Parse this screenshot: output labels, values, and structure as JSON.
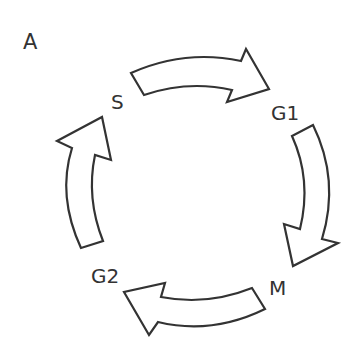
{
  "panel_label": "A",
  "diagram": {
    "type": "cycle",
    "phases": [
      {
        "id": "s",
        "label": "S"
      },
      {
        "id": "g1",
        "label": "G1"
      },
      {
        "id": "m",
        "label": "M"
      },
      {
        "id": "g2",
        "label": "G2"
      }
    ],
    "arrows": [
      {
        "from": "S",
        "to": "G1"
      },
      {
        "from": "G1",
        "to": "M"
      },
      {
        "from": "M",
        "to": "G2"
      },
      {
        "from": "G2",
        "to": "S"
      }
    ],
    "stroke_color": "#333333",
    "fill_color": "#ffffff"
  }
}
